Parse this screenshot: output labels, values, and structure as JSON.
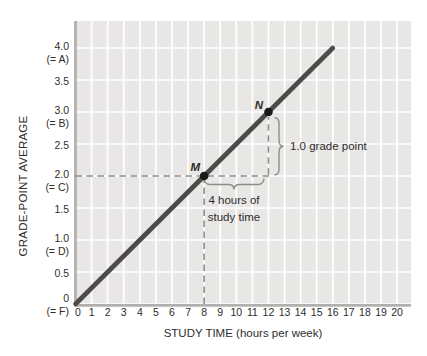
{
  "chart_data": {
    "type": "line",
    "title": "",
    "xlabel": "STUDY TIME (hours per week)",
    "ylabel": "GRADE-POINT AVERAGE",
    "xlim": [
      0,
      20.9
    ],
    "ylim": [
      0,
      4.42
    ],
    "grid": true,
    "legend": false,
    "x_ticks": [
      "0",
      "1",
      "2",
      "3",
      "4",
      "5",
      "6",
      "7",
      "8",
      "9",
      "10",
      "11",
      "12",
      "13",
      "14",
      "15",
      "16",
      "17",
      "18",
      "19",
      "20"
    ],
    "y_ticks": [
      {
        "value": 4.0,
        "label": "4.0",
        "sub": "(= A)"
      },
      {
        "value": 3.5,
        "label": "3.5"
      },
      {
        "value": 3.0,
        "label": "3.0",
        "sub": "(= B)"
      },
      {
        "value": 2.5,
        "label": "2.5"
      },
      {
        "value": 2.0,
        "label": "2.0",
        "sub": "(= C)"
      },
      {
        "value": 1.5,
        "label": "1.5"
      },
      {
        "value": 1.0,
        "label": "1.0",
        "sub": "(= D)"
      },
      {
        "value": 0.5,
        "label": "0.5"
      },
      {
        "value": 0.0,
        "label": "0",
        "sub": "(= F)"
      }
    ],
    "series": [
      {
        "name": "GPA vs study time",
        "x": [
          0,
          16
        ],
        "y": [
          0,
          4.0
        ],
        "slope": 0.25
      }
    ],
    "points": [
      {
        "name": "M",
        "x": 8,
        "y": 2.0
      },
      {
        "name": "N",
        "x": 12,
        "y": 3.0
      }
    ],
    "dashed_guides": [
      {
        "type": "h",
        "y": 2.0,
        "from_x": 0,
        "to_x": 12.26
      },
      {
        "type": "v",
        "x": 8,
        "from_y": 0,
        "to_y": 2.0
      },
      {
        "type": "v",
        "x": 12,
        "from_y": 2.02,
        "to_y": 2.92
      }
    ],
    "annotations": [
      {
        "kind": "vertical-brace",
        "text": "1.0 grade point",
        "x": 12.7,
        "y_from": 2.02,
        "y_to": 2.92
      },
      {
        "kind": "horizontal-brace",
        "line1": "4 hours of",
        "line2": "study time",
        "y": 1.95,
        "x_from": 8.05,
        "x_to": 11.76
      }
    ],
    "colors": {
      "plot_bg": "#e8e7e5",
      "grid": "#ffffff",
      "axis": "#b2b0ad",
      "line": "#4d4b49",
      "guide": "#8f8d8a",
      "point": "#1b1918",
      "text": "#2f2d2b"
    }
  }
}
